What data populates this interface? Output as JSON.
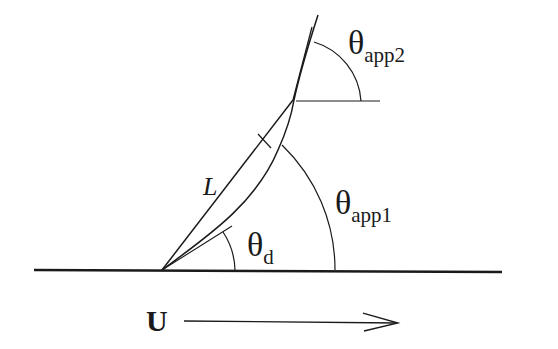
{
  "diagram": {
    "type": "contact-angle-geometry",
    "colors": {
      "background": "#ffffff",
      "stroke": "#1a1a1a"
    },
    "labels": {
      "theta_app2": {
        "symbol": "θ",
        "subscript": "app2"
      },
      "theta_app1": {
        "symbol": "θ",
        "subscript": "app1"
      },
      "theta_d": {
        "symbol": "θ",
        "subscript": "d"
      },
      "length": "L",
      "velocity": "U"
    },
    "elements": [
      "ground-line",
      "straight-chord-L",
      "curved-interface",
      "upper-tangent-line",
      "horizontal-reference-line",
      "arc-theta-app2",
      "arc-theta-app1",
      "arc-theta-d",
      "velocity-arrow"
    ]
  }
}
